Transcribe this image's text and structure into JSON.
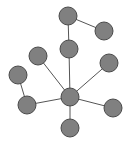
{
  "figure": {
    "background_color": "#ffffff",
    "width": 130,
    "height": 145
  },
  "chart_data": {
    "type": "scatter",
    "subtype": "node-link-network-diagram",
    "title": "",
    "subtitle": "",
    "xlabel": "",
    "ylabel": "",
    "xlim": [
      0,
      130
    ],
    "ylim": [
      0,
      145
    ],
    "grid": false,
    "axes_visible": false,
    "legend": null,
    "tick_labels": {
      "x": [],
      "y": []
    },
    "annotations": [],
    "style": {
      "node_fill": "#808080",
      "node_stroke": "#4a4a4a",
      "node_stroke_width": 1,
      "node_radius": 9,
      "edge_color": "#555555",
      "edge_width": 1,
      "background": "#ffffff"
    },
    "node_count": 10,
    "edge_count": 9,
    "hub_node": "n7",
    "hub_degree": 6,
    "nodes": [
      {
        "id": "n1",
        "label": "",
        "x": 68,
        "y": 16,
        "r": 9,
        "degree": 2,
        "role": "top-node"
      },
      {
        "id": "n2",
        "label": "",
        "x": 104,
        "y": 31,
        "r": 9,
        "degree": 1,
        "role": "top-right-leaf"
      },
      {
        "id": "n3",
        "label": "",
        "x": 69,
        "y": 49,
        "r": 9,
        "degree": 2,
        "role": "upper-middle-node"
      },
      {
        "id": "n4",
        "label": "",
        "x": 38,
        "y": 56,
        "r": 9,
        "degree": 1,
        "role": "upper-left-leaf"
      },
      {
        "id": "n5",
        "label": "",
        "x": 18,
        "y": 75,
        "r": 9,
        "degree": 1,
        "role": "far-left-leaf"
      },
      {
        "id": "n6",
        "label": "",
        "x": 109,
        "y": 63,
        "r": 9,
        "degree": 1,
        "role": "right-upper-leaf"
      },
      {
        "id": "n7",
        "label": "",
        "x": 70,
        "y": 97,
        "r": 9,
        "degree": 6,
        "role": "center-hub"
      },
      {
        "id": "n8",
        "label": "",
        "x": 27,
        "y": 105,
        "r": 9,
        "degree": 2,
        "role": "lower-left-node"
      },
      {
        "id": "n9",
        "label": "",
        "x": 113,
        "y": 108,
        "r": 9,
        "degree": 1,
        "role": "right-lower-leaf"
      },
      {
        "id": "n10",
        "label": "",
        "x": 70,
        "y": 128,
        "r": 9,
        "degree": 1,
        "role": "bottom-leaf"
      }
    ],
    "edges": [
      {
        "id": "e1",
        "source": "n1",
        "target": "n2"
      },
      {
        "id": "e2",
        "source": "n1",
        "target": "n3"
      },
      {
        "id": "e3",
        "source": "n3",
        "target": "n7"
      },
      {
        "id": "e4",
        "source": "n4",
        "target": "n7"
      },
      {
        "id": "e5",
        "source": "n5",
        "target": "n8"
      },
      {
        "id": "e6",
        "source": "n8",
        "target": "n7"
      },
      {
        "id": "e7",
        "source": "n6",
        "target": "n7"
      },
      {
        "id": "e8",
        "source": "n7",
        "target": "n9"
      },
      {
        "id": "e9",
        "source": "n7",
        "target": "n10"
      }
    ]
  }
}
